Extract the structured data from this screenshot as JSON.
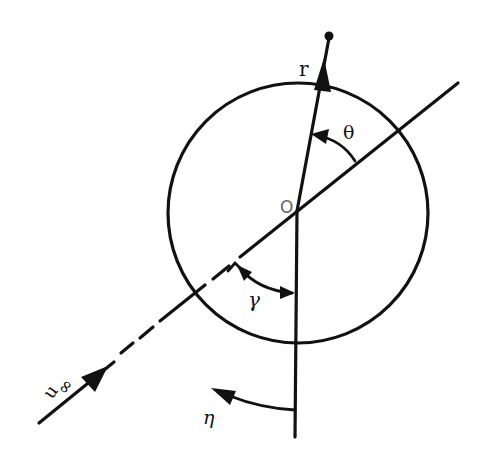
{
  "diagram": {
    "type": "geometry-figure",
    "colors": {
      "ink": "#111111",
      "origin_label": "#666666",
      "background": "#ffffff"
    },
    "labels": {
      "radius_vector": "r",
      "theta": "θ",
      "origin": "O",
      "gamma": "γ",
      "eta": "η",
      "freestream_u": "u",
      "freestream_sub": "∞"
    },
    "elements": {
      "circle": {
        "cx": 298,
        "cy": 213,
        "r": 130
      },
      "origin": {
        "x": 297,
        "y": 211
      },
      "radius_vector": {
        "from": [
          297,
          211
        ],
        "to": [
          329,
          35
        ],
        "arrowhead": "at circle top, pointing outward",
        "end_marker": "dot"
      },
      "vertical_axis": {
        "from": [
          297,
          211
        ],
        "to": [
          295,
          437
        ]
      },
      "freestream_line": {
        "from": [
          39,
          423
        ],
        "to": [
          458,
          83
        ],
        "dashed_segment": "between approx x=120 and x=260"
      },
      "angles": [
        {
          "name": "theta",
          "between": [
            "radius_vector",
            "freestream_line"
          ],
          "arrow": "toward radius_vector"
        },
        {
          "name": "gamma",
          "between": [
            "freestream_line",
            "vertical_axis"
          ],
          "arrow": "double-headed"
        },
        {
          "name": "eta",
          "reference": "vertical_axis",
          "arrow": "counter-clockwise to the left"
        }
      ]
    }
  }
}
